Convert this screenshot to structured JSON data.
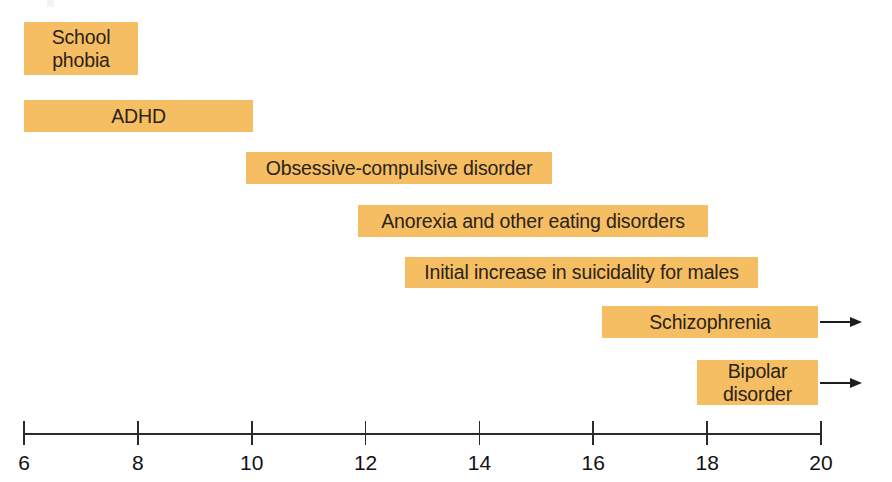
{
  "chart_data": {
    "type": "bar",
    "orientation": "horizontal",
    "title": "",
    "subtitle": "",
    "xlabel": "",
    "ylabel": "",
    "xlim": [
      6,
      20
    ],
    "x_ticks": [
      6,
      8,
      10,
      12,
      14,
      16,
      18,
      20
    ],
    "x_tick_labels": [
      "6",
      "8",
      "10",
      "12",
      "14",
      "16",
      "18",
      "20"
    ],
    "grid": false,
    "legend": null,
    "bar_color": "#f5be63",
    "text_color": "#2b2218",
    "axis_color": "#2a2a2a",
    "background": "#ffffff",
    "categories": [
      "School phobia",
      "ADHD",
      "Obsessive-compulsive disorder",
      "Anorexia and other eating disorders",
      "Initial increase in suicidality for males",
      "Schizophrenia",
      "Bipolar disorder"
    ],
    "bars": [
      {
        "label": "School\nphobia",
        "label_plain": "School phobia",
        "start": 6.0,
        "end": 8.0,
        "open_ended": false,
        "align": "center",
        "lines": 2
      },
      {
        "label": "ADHD",
        "label_plain": "ADHD",
        "start": 6.0,
        "end": 10.0,
        "open_ended": false,
        "align": "center",
        "lines": 1
      },
      {
        "label": "Obsessive-compulsive disorder",
        "label_plain": "Obsessive-compulsive disorder",
        "start": 9.9,
        "end": 15.3,
        "open_ended": false,
        "align": "center",
        "lines": 1
      },
      {
        "label": "Anorexia and other eating disorders",
        "label_plain": "Anorexia and other eating disorders",
        "start": 11.9,
        "end": 18.0,
        "open_ended": false,
        "align": "center",
        "lines": 1
      },
      {
        "label": "Initial increase in suicidality for males",
        "label_plain": "Initial increase in suicidality for males",
        "start": 12.7,
        "end": 18.9,
        "open_ended": false,
        "align": "center",
        "lines": 1
      },
      {
        "label": "Schizophrenia",
        "label_plain": "Schizophrenia",
        "start": 16.2,
        "end": 20.0,
        "open_ended": true,
        "align": "center",
        "lines": 1
      },
      {
        "label": "Bipolar\ndisorder",
        "label_plain": "Bipolar disorder",
        "start": 17.8,
        "end": 20.0,
        "open_ended": true,
        "align": "center",
        "lines": 2
      }
    ]
  }
}
